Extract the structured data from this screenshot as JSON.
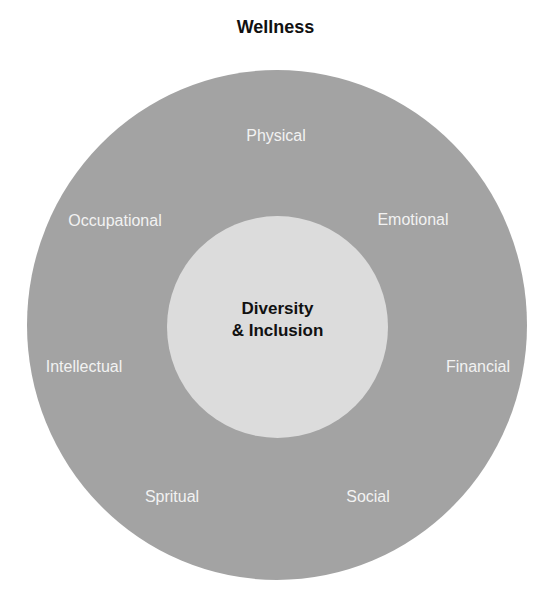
{
  "title": "Wellness",
  "center": {
    "line1": "Diversity",
    "line2": "& Inclusion"
  },
  "dimensions": [
    {
      "label": "Physical",
      "x": 276,
      "y": 136
    },
    {
      "label": "Emotional",
      "x": 413,
      "y": 220
    },
    {
      "label": "Financial",
      "x": 478,
      "y": 367
    },
    {
      "label": "Social",
      "x": 368,
      "y": 497
    },
    {
      "label": "Spritual",
      "x": 172,
      "y": 497
    },
    {
      "label": "Intellectual",
      "x": 84,
      "y": 367
    },
    {
      "label": "Occupational",
      "x": 115,
      "y": 221
    }
  ],
  "colors": {
    "outer": "#a3a3a3",
    "inner": "#dcdcdc",
    "dimension_text": "#f2f2f2"
  }
}
